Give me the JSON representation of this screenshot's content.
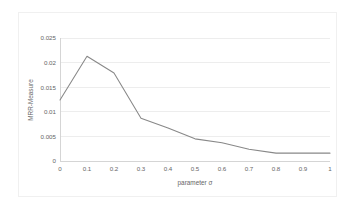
{
  "figure": {
    "background_color": "#ffffff",
    "frame_color": "#f0f0f0",
    "plot_area": {
      "left": 60,
      "top": 38,
      "right": 330,
      "bottom": 161
    }
  },
  "chart_data": {
    "type": "line",
    "title": "",
    "xlabel": "parameter σ",
    "ylabel": "MRR-Measure",
    "x": [
      0,
      0.1,
      0.2,
      0.3,
      0.4,
      0.5,
      0.6,
      0.7,
      0.8,
      0.9,
      1
    ],
    "values": [
      0.0124,
      0.0213,
      0.0179,
      0.0087,
      0.0067,
      0.0045,
      0.0037,
      0.0024,
      0.0016,
      0.0016,
      0.0016
    ],
    "series": [
      {
        "name": "MRR-Measure",
        "color": "#888888",
        "values": [
          0.0124,
          0.0213,
          0.0179,
          0.0087,
          0.0067,
          0.0045,
          0.0037,
          0.0024,
          0.0016,
          0.0016,
          0.0016
        ]
      }
    ],
    "xlim": [
      0,
      1
    ],
    "ylim": [
      0,
      0.025
    ],
    "xticks": [
      0,
      0.1,
      0.2,
      0.3,
      0.4,
      0.5,
      0.6,
      0.7,
      0.8,
      0.9,
      1
    ],
    "xtick_labels": [
      "0",
      "0.1",
      "0.2",
      "0.3",
      "0.4",
      "0.5",
      "0.6",
      "0.7",
      "0.8",
      "0.9",
      "1"
    ],
    "yticks": [
      0,
      0.005,
      0.01,
      0.015,
      0.02,
      0.025
    ],
    "ytick_labels": [
      "0",
      "0.005",
      "0.01",
      "0.015",
      "0.02",
      "0.025"
    ],
    "grid": {
      "horizontal": true,
      "vertical": false,
      "color": "#e8e8e8"
    },
    "legend": {
      "visible": false,
      "position": "none"
    },
    "annotations": []
  }
}
